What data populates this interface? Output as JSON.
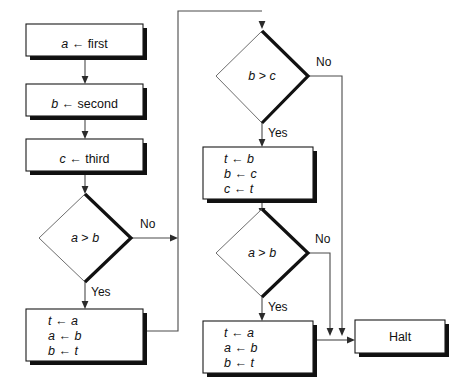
{
  "diagram": {
    "background": "#ffffff",
    "line_color": "#4a4a4a",
    "shadow_color": "#111111"
  },
  "nodes": {
    "assign_a": {
      "line1": "a ← first"
    },
    "assign_b": {
      "line1": "b ← second"
    },
    "assign_c": {
      "line1": "c ← third"
    },
    "decision_ab_left": {
      "text": "a > b"
    },
    "swap_ab_left": {
      "line1": "t ← a",
      "line2": "a ← b",
      "line3": "b ← t"
    },
    "decision_bc": {
      "text": "b > c"
    },
    "swap_bc": {
      "line1": "t ← b",
      "line2": "b ← c",
      "line3": "c ← t"
    },
    "decision_ab_right": {
      "text": "a > b"
    },
    "swap_ab_right": {
      "line1": "t ← a",
      "line2": "a ← b",
      "line3": "b ← t"
    },
    "halt": {
      "text": "Halt"
    }
  },
  "branch_labels": {
    "left_ab_no": "No",
    "left_ab_yes": "Yes",
    "bc_no": "No",
    "bc_yes": "Yes",
    "right_ab_no": "No",
    "right_ab_yes": "Yes"
  }
}
